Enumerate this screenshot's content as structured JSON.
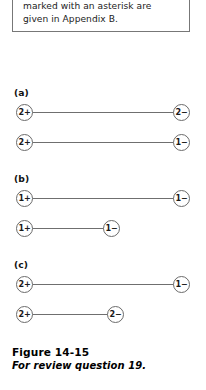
{
  "textbox": {
    "lines": [
      "marked with an asterisk are",
      "given in Appendix B."
    ]
  },
  "figure": {
    "groups": [
      {
        "label": "(a)",
        "label_y": 55,
        "pairs": [
          {
            "left_charge": "2+",
            "right_charge": "2−",
            "left_x": 16,
            "right_x": 173,
            "y": 72
          },
          {
            "left_charge": "2+",
            "right_charge": "1−",
            "left_x": 16,
            "right_x": 173,
            "y": 102
          }
        ]
      },
      {
        "label": "(b)",
        "label_y": 141,
        "pairs": [
          {
            "left_charge": "1+",
            "right_charge": "1−",
            "left_x": 16,
            "right_x": 173,
            "y": 158
          },
          {
            "left_charge": "1+",
            "right_charge": "1−",
            "left_x": 16,
            "right_x": 103,
            "y": 188
          }
        ]
      },
      {
        "label": "(c)",
        "label_y": 227,
        "pairs": [
          {
            "left_charge": "2+",
            "right_charge": "1−",
            "left_x": 16,
            "right_x": 173,
            "y": 244
          },
          {
            "left_charge": "2+",
            "right_charge": "2−",
            "left_x": 16,
            "right_x": 107,
            "y": 274
          }
        ]
      }
    ]
  },
  "caption": {
    "title": "Figure 14-15",
    "subtitle": "For review question 19."
  },
  "colors": {
    "node_stroke": "#6b6b6b",
    "bond": "#6f6f6f",
    "box_border": "#777777",
    "text": "#111111"
  }
}
